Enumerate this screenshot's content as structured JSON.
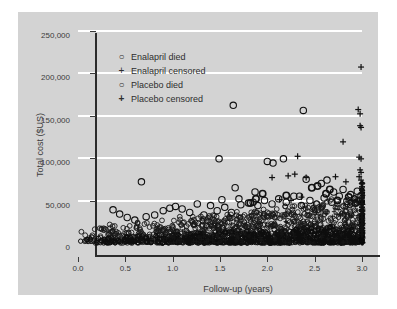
{
  "chart_data": {
    "type": "scatter",
    "title": "",
    "xlabel": "Follow-up (years)",
    "ylabel": "Total cost ($US)",
    "xlim": [
      0.0,
      3.0
    ],
    "ylim": [
      0,
      260000
    ],
    "xticks": [
      "0.0",
      "0.5",
      "1.0",
      "1.5",
      "2.0",
      "2.5",
      "3.0"
    ],
    "xtick_values": [
      0.0,
      0.5,
      1.0,
      1.5,
      2.0,
      2.5,
      3.0
    ],
    "yticks": [
      "0",
      "50,000",
      "100,000",
      "150,000",
      "200,000",
      "250,000"
    ],
    "ytick_values": [
      0,
      50000,
      100000,
      150000,
      200000,
      250000
    ],
    "grid": "horizontal-white",
    "legend_position": "top-left-inside",
    "legend": [
      {
        "marker": "circle",
        "symbol": "○",
        "bold": false,
        "label": "Enalapril died"
      },
      {
        "marker": "plus",
        "symbol": "+",
        "bold": false,
        "label": "Enalapril censored"
      },
      {
        "marker": "circle",
        "symbol": "○",
        "bold": true,
        "label": "Placebo died"
      },
      {
        "marker": "plus",
        "symbol": "+",
        "bold": true,
        "label": "Placebo censored"
      }
    ],
    "series": [
      {
        "name": "Enalapril died",
        "marker": "circle",
        "points": [
          [
            0.67,
            72000
          ],
          [
            1.49,
            99000
          ],
          [
            1.64,
            162000
          ],
          [
            1.85,
            48000
          ],
          [
            1.52,
            51000
          ],
          [
            1.7,
            52000
          ],
          [
            1.66,
            65000
          ],
          [
            1.87,
            60000
          ],
          [
            2.0,
            96000
          ],
          [
            2.06,
            94000
          ],
          [
            2.17,
            99000
          ],
          [
            2.38,
            156000
          ],
          [
            2.34,
            55000
          ],
          [
            2.41,
            75000
          ],
          [
            2.57,
            70000
          ],
          [
            2.63,
            74000
          ],
          [
            2.7,
            60000
          ],
          [
            2.8,
            63000
          ],
          [
            2.88,
            57000
          ],
          [
            2.95,
            61000
          ],
          [
            0.37,
            39000
          ],
          [
            0.44,
            34000
          ],
          [
            0.52,
            30000
          ],
          [
            0.6,
            27000
          ],
          [
            0.72,
            31000
          ],
          [
            0.81,
            33000
          ],
          [
            0.9,
            38000
          ],
          [
            0.97,
            41000
          ],
          [
            1.03,
            43000
          ],
          [
            1.1,
            40000
          ],
          [
            1.18,
            36000
          ],
          [
            1.26,
            46000
          ],
          [
            1.33,
            33000
          ],
          [
            1.4,
            44000
          ],
          [
            1.47,
            38000
          ],
          [
            1.55,
            42000
          ],
          [
            1.62,
            36000
          ],
          [
            1.72,
            45000
          ],
          [
            1.8,
            47000
          ],
          [
            1.9,
            44000
          ],
          [
            1.97,
            50000
          ],
          [
            2.05,
            46000
          ],
          [
            2.12,
            52000
          ],
          [
            2.2,
            48000
          ],
          [
            2.28,
            55000
          ],
          [
            2.36,
            44000
          ],
          [
            2.45,
            50000
          ],
          [
            2.52,
            46000
          ],
          [
            2.6,
            53000
          ],
          [
            2.68,
            48000
          ],
          [
            2.76,
            55000
          ],
          [
            2.84,
            49000
          ],
          [
            2.92,
            52000
          ],
          [
            2.99,
            56000
          ]
        ]
      },
      {
        "name": "Enalapril censored",
        "marker": "plus",
        "points": [
          [
            2.05,
            77000
          ],
          [
            2.22,
            79000
          ],
          [
            2.29,
            81000
          ],
          [
            2.32,
            102000
          ],
          [
            2.8,
            119000
          ],
          [
            2.96,
            157000
          ],
          [
            2.99,
            207000
          ],
          [
            2.98,
            152000
          ],
          [
            2.98,
            138000
          ],
          [
            2.99,
            136000
          ],
          [
            2.97,
            101000
          ],
          [
            2.99,
            99000
          ],
          [
            2.98,
            86000
          ],
          [
            2.99,
            83000
          ],
          [
            2.97,
            78000
          ],
          [
            2.99,
            74000
          ],
          [
            2.72,
            78000
          ],
          [
            2.83,
            72000
          ],
          [
            2.41,
            77000
          ],
          [
            2.13,
            51000
          ],
          [
            2.25,
            50000
          ],
          [
            2.36,
            54000
          ]
        ]
      },
      {
        "name": "Placebo died",
        "marker": "circle",
        "points": [
          [
            2.47,
            65000
          ],
          [
            2.53,
            67000
          ],
          [
            2.66,
            63000
          ],
          [
            2.2,
            56000
          ],
          [
            1.95,
            58000
          ],
          [
            1.88,
            52000
          ],
          [
            1.82,
            47000
          ],
          [
            2.62,
            58000
          ],
          [
            2.74,
            50000
          ],
          [
            2.86,
            54000
          ],
          [
            2.93,
            47000
          ]
        ]
      },
      {
        "name": "Placebo censored",
        "marker": "plus",
        "points": [
          [
            3.0,
            70000
          ],
          [
            3.0,
            66000
          ],
          [
            3.0,
            62000
          ],
          [
            3.0,
            58000
          ],
          [
            3.0,
            54000
          ],
          [
            3.0,
            50000
          ],
          [
            3.0,
            46000
          ],
          [
            3.0,
            42000
          ],
          [
            3.0,
            38000
          ],
          [
            3.0,
            34000
          ],
          [
            3.0,
            30000
          ],
          [
            3.0,
            26000
          ],
          [
            3.0,
            22000
          ],
          [
            3.0,
            18000
          ],
          [
            3.0,
            14000
          ],
          [
            3.0,
            10000
          ]
        ]
      }
    ],
    "dense_cluster_note": "Hundreds of overlapping open circles and plus markers fill the band from $0 to roughly $45,000 across the full 0-3 year range, thickening toward 3.0 years, with a solid vertical stack of censored plus markers at x = 3.0."
  }
}
